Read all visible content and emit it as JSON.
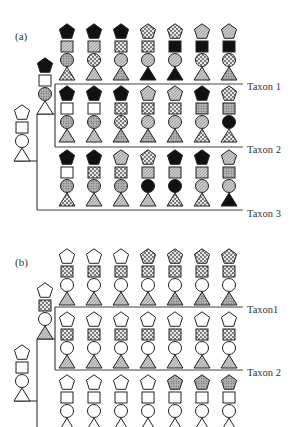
{
  "legend_fills": {
    "W": "white / plain",
    "B": "black / solid",
    "G": "gray (light diagonal hatch)",
    "C": "cross-hatch (checker)",
    "D": "dotted stipple"
  },
  "colors": {
    "stroke": "#222222",
    "black": "#111111",
    "gray": "#bdbdbd",
    "line": "#444444"
  },
  "panels": [
    {
      "label": "(a)",
      "root": {
        "pentagon": "W",
        "square": "W",
        "circle": "W",
        "triangle": "W"
      },
      "internal": {
        "pentagon": "B",
        "square": "W",
        "circle": "D",
        "triangle": "W"
      },
      "taxa": [
        {
          "name": "Taxon 1",
          "columns": [
            {
              "pentagon": "B",
              "square": "G",
              "circle": "D",
              "triangle": "C"
            },
            {
              "pentagon": "B",
              "square": "G",
              "circle": "C",
              "triangle": "G"
            },
            {
              "pentagon": "B",
              "square": "C",
              "circle": "G",
              "triangle": "D"
            },
            {
              "pentagon": "C",
              "square": "C",
              "circle": "G",
              "triangle": "B"
            },
            {
              "pentagon": "C",
              "square": "B",
              "circle": "G",
              "triangle": "B"
            },
            {
              "pentagon": "G",
              "square": "B",
              "circle": "C",
              "triangle": "G"
            },
            {
              "pentagon": "G",
              "square": "B",
              "circle": "C",
              "triangle": "D"
            }
          ]
        },
        {
          "name": "Taxon 2",
          "columns": [
            {
              "pentagon": "B",
              "square": "W",
              "circle": "D",
              "triangle": "G"
            },
            {
              "pentagon": "B",
              "square": "W",
              "circle": "D",
              "triangle": "G"
            },
            {
              "pentagon": "B",
              "square": "C",
              "circle": "C",
              "triangle": "D"
            },
            {
              "pentagon": "G",
              "square": "C",
              "circle": "G",
              "triangle": "D"
            },
            {
              "pentagon": "G",
              "square": "C",
              "circle": "G",
              "triangle": "D"
            },
            {
              "pentagon": "B",
              "square": "D",
              "circle": "G",
              "triangle": "C"
            },
            {
              "pentagon": "C",
              "square": "D",
              "circle": "B",
              "triangle": "C"
            }
          ]
        },
        {
          "name": "Taxon 3",
          "columns": [
            {
              "pentagon": "B",
              "square": "W",
              "circle": "D",
              "triangle": "C"
            },
            {
              "pentagon": "B",
              "square": "C",
              "circle": "D",
              "triangle": "G"
            },
            {
              "pentagon": "G",
              "square": "C",
              "circle": "D",
              "triangle": "G"
            },
            {
              "pentagon": "C",
              "square": "G",
              "circle": "B",
              "triangle": "G"
            },
            {
              "pentagon": "B",
              "square": "G",
              "circle": "B",
              "triangle": "C"
            },
            {
              "pentagon": "B",
              "square": "G",
              "circle": "G",
              "triangle": "C"
            },
            {
              "pentagon": "G",
              "square": "D",
              "circle": "G",
              "triangle": "B"
            }
          ]
        }
      ]
    },
    {
      "label": "(b)",
      "root": {
        "pentagon": "W",
        "square": "W",
        "circle": "W",
        "triangle": "W"
      },
      "internal": {
        "pentagon": "W",
        "square": "C",
        "circle": "W",
        "triangle": "G"
      },
      "taxa": [
        {
          "name": "Taxon1",
          "columns": [
            {
              "pentagon": "W",
              "square": "C",
              "circle": "W",
              "triangle": "G"
            },
            {
              "pentagon": "W",
              "square": "C",
              "circle": "W",
              "triangle": "G"
            },
            {
              "pentagon": "W",
              "square": "C",
              "circle": "W",
              "triangle": "G"
            },
            {
              "pentagon": "C",
              "square": "C",
              "circle": "W",
              "triangle": "G"
            },
            {
              "pentagon": "C",
              "square": "C",
              "circle": "W",
              "triangle": "D"
            },
            {
              "pentagon": "C",
              "square": "C",
              "circle": "W",
              "triangle": "D"
            },
            {
              "pentagon": "C",
              "square": "C",
              "circle": "W",
              "triangle": "D"
            }
          ]
        },
        {
          "name": "Taxon 2",
          "columns": [
            {
              "pentagon": "W",
              "square": "C",
              "circle": "W",
              "triangle": "G"
            },
            {
              "pentagon": "W",
              "square": "C",
              "circle": "W",
              "triangle": "G"
            },
            {
              "pentagon": "W",
              "square": "C",
              "circle": "W",
              "triangle": "G"
            },
            {
              "pentagon": "W",
              "square": "C",
              "circle": "W",
              "triangle": "G"
            },
            {
              "pentagon": "W",
              "square": "C",
              "circle": "W",
              "triangle": "G"
            },
            {
              "pentagon": "W",
              "square": "C",
              "circle": "W",
              "triangle": "G"
            },
            {
              "pentagon": "W",
              "square": "C",
              "circle": "W",
              "triangle": "G"
            }
          ]
        },
        {
          "name": "",
          "columns": [
            {
              "pentagon": "W",
              "square": "W",
              "circle": "W",
              "triangle": "W"
            },
            {
              "pentagon": "W",
              "square": "W",
              "circle": "W",
              "triangle": "W"
            },
            {
              "pentagon": "W",
              "square": "W",
              "circle": "W",
              "triangle": "W"
            },
            {
              "pentagon": "W",
              "square": "W",
              "circle": "W",
              "triangle": "W"
            },
            {
              "pentagon": "D",
              "square": "W",
              "circle": "W",
              "triangle": "W"
            },
            {
              "pentagon": "D",
              "square": "W",
              "circle": "W",
              "triangle": "W"
            },
            {
              "pentagon": "D",
              "square": "W",
              "circle": "W",
              "triangle": "W"
            }
          ]
        }
      ]
    }
  ]
}
